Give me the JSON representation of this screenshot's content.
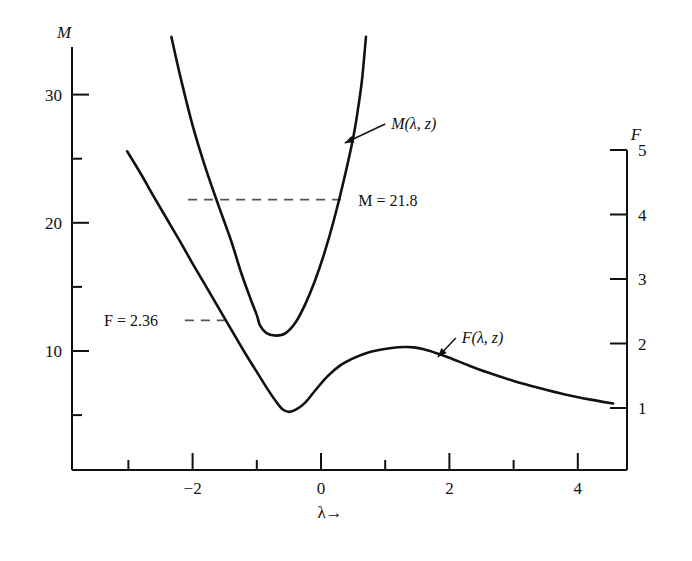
{
  "figure": {
    "background": "#ffffff",
    "ink_color": "#111111",
    "dash_color": "#555555"
  },
  "chart_data": {
    "type": "line",
    "title": "",
    "xlabel": "λ→",
    "ylabel_left": "M",
    "ylabel_right": "F",
    "xlim": [
      -3.4,
      4.9
    ],
    "ylim_left": [
      0.7,
      34.3
    ],
    "ylim_right": [
      0.18,
      6.0
    ],
    "grid": false,
    "xticks_major": [
      -2,
      0,
      2,
      4
    ],
    "xticks_major_labels": [
      "-2",
      "0",
      "2",
      "4"
    ],
    "xticks_minor": [
      -3,
      -1,
      1,
      3
    ],
    "yticks_left_major": [
      10,
      20,
      30
    ],
    "yticks_left_major_labels": [
      "10",
      "20",
      "30"
    ],
    "yticks_left_minor": [
      5,
      15,
      25
    ],
    "yticks_right_major": [
      1,
      2,
      3,
      4,
      5
    ],
    "yticks_right_major_labels": [
      "1",
      "2",
      "3",
      "4",
      "5"
    ],
    "series": [
      {
        "name": "M(λ, z)",
        "axis": "left",
        "label": "M(λ, z)",
        "points": [
          [
            -2.33,
            34.5
          ],
          [
            -2.2,
            31.6
          ],
          [
            -2.0,
            27.6
          ],
          [
            -1.8,
            24.3
          ],
          [
            -1.6,
            21.4
          ],
          [
            -1.4,
            18.6
          ],
          [
            -1.25,
            16.2
          ],
          [
            -1.1,
            14.1
          ],
          [
            -1.0,
            12.8
          ],
          [
            -0.95,
            12.0
          ],
          [
            -0.85,
            11.4
          ],
          [
            -0.7,
            11.2
          ],
          [
            -0.55,
            11.4
          ],
          [
            -0.4,
            12.2
          ],
          [
            -0.25,
            13.6
          ],
          [
            -0.1,
            15.4
          ],
          [
            0.05,
            17.6
          ],
          [
            0.2,
            20.2
          ],
          [
            0.35,
            23.2
          ],
          [
            0.5,
            26.6
          ],
          [
            0.58,
            29.0
          ],
          [
            0.64,
            31.2
          ],
          [
            0.7,
            34.5
          ]
        ]
      },
      {
        "name": "F(λ, z)",
        "axis": "right",
        "label": "F(λ, z)",
        "points": [
          [
            -3.02,
            4.98
          ],
          [
            -2.8,
            4.62
          ],
          [
            -2.6,
            4.27
          ],
          [
            -2.4,
            3.93
          ],
          [
            -2.2,
            3.59
          ],
          [
            -2.0,
            3.24
          ],
          [
            -1.8,
            2.9
          ],
          [
            -1.6,
            2.56
          ],
          [
            -1.4,
            2.22
          ],
          [
            -1.2,
            1.88
          ],
          [
            -1.0,
            1.56
          ],
          [
            -0.85,
            1.32
          ],
          [
            -0.7,
            1.1
          ],
          [
            -0.6,
            0.98
          ],
          [
            -0.5,
            0.94
          ],
          [
            -0.4,
            0.97
          ],
          [
            -0.25,
            1.08
          ],
          [
            -0.1,
            1.26
          ],
          [
            0.1,
            1.49
          ],
          [
            0.3,
            1.66
          ],
          [
            0.5,
            1.77
          ],
          [
            0.7,
            1.85
          ],
          [
            0.9,
            1.9
          ],
          [
            1.1,
            1.93
          ],
          [
            1.3,
            1.945
          ],
          [
            1.45,
            1.94
          ],
          [
            1.6,
            1.91
          ],
          [
            1.8,
            1.85
          ],
          [
            2.0,
            1.78
          ],
          [
            2.3,
            1.66
          ],
          [
            2.6,
            1.55
          ],
          [
            3.0,
            1.42
          ],
          [
            3.4,
            1.31
          ],
          [
            3.8,
            1.21
          ],
          [
            4.2,
            1.13
          ],
          [
            4.55,
            1.07
          ]
        ]
      }
    ],
    "annotations": [
      {
        "name": "m-threshold",
        "label": "M = 21.8",
        "value": 21.8,
        "axis": "left",
        "style": "dashed-horizontal",
        "x_from": -2.07,
        "x_to": 0.37,
        "text_x": 0.58
      },
      {
        "name": "f-threshold",
        "label": "F = 2.36",
        "value": 2.36,
        "axis": "right",
        "style": "dashed-horizontal",
        "x_from": -2.12,
        "x_to": -1.45,
        "text_x": -3.38
      },
      {
        "name": "m-curve-callout",
        "label": "M(λ, z)",
        "arrow_from_x": 1.0,
        "arrow_from_y_px": 124,
        "arrow_to_x": 0.37,
        "arrow_to_y_px": 143
      },
      {
        "name": "f-curve-callout",
        "label": "F(λ, z)",
        "arrow_from_x": 2.1,
        "arrow_from_y_px": 338,
        "arrow_to_x": 1.82,
        "arrow_to_y_px": 357
      }
    ]
  }
}
